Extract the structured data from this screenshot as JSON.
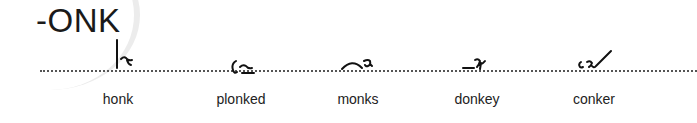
{
  "heading": "-ONK",
  "words": [
    {
      "label": "honk",
      "outline_icon": "shorthand-honk"
    },
    {
      "label": "plonked",
      "outline_icon": "shorthand-plonked"
    },
    {
      "label": "monks",
      "outline_icon": "shorthand-monks"
    },
    {
      "label": "donkey",
      "outline_icon": "shorthand-donkey"
    },
    {
      "label": "conker",
      "outline_icon": "shorthand-conker"
    }
  ]
}
